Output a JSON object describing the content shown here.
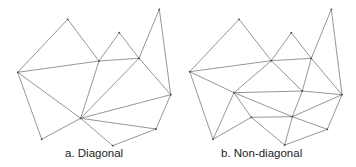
{
  "diagrams": [
    {
      "id": "diagonal",
      "caption": "a. Diagonal",
      "caption_x": 65,
      "vertices": {
        "A": [
          17.7,
          72.3
        ],
        "B": [
          67.7,
          19.3
        ],
        "C": [
          99,
          61
        ],
        "D": [
          119.3,
          32.7
        ],
        "E": [
          139,
          58.3
        ],
        "F": [
          159.3,
          9.3
        ],
        "G": [
          170.7,
          94.7
        ],
        "H": [
          80.7,
          118.3
        ],
        "I": [
          156,
          129
        ],
        "J": [
          112.7,
          145.7
        ],
        "K": [
          41.7,
          139.3
        ]
      },
      "edges": [
        [
          "A",
          "B"
        ],
        [
          "B",
          "C"
        ],
        [
          "A",
          "C"
        ],
        [
          "C",
          "D"
        ],
        [
          "D",
          "E"
        ],
        [
          "C",
          "E"
        ],
        [
          "E",
          "F"
        ],
        [
          "F",
          "G"
        ],
        [
          "E",
          "G"
        ],
        [
          "A",
          "H"
        ],
        [
          "C",
          "H"
        ],
        [
          "E",
          "H"
        ],
        [
          "G",
          "H"
        ],
        [
          "H",
          "I"
        ],
        [
          "I",
          "G"
        ],
        [
          "H",
          "J"
        ],
        [
          "J",
          "I"
        ],
        [
          "A",
          "K"
        ],
        [
          "K",
          "H"
        ]
      ]
    },
    {
      "id": "non-diagonal",
      "caption": "b. Non-diagonal",
      "caption_x": 221,
      "vertices": {
        "A": [
          189.7,
          71.7
        ],
        "B": [
          239,
          19.3
        ],
        "C": [
          271.3,
          60.7
        ],
        "D": [
          291.3,
          32.7
        ],
        "E": [
          311.3,
          58.3
        ],
        "F": [
          331.3,
          9.3
        ],
        "G": [
          342,
          94.7
        ],
        "P": [
          234,
          92.7
        ],
        "Q": [
          302.3,
          91
        ],
        "R": [
          251.3,
          117.3
        ],
        "S": [
          292.3,
          116.7
        ],
        "T": [
          327.3,
          129.3
        ],
        "J": [
          284.7,
          145
        ],
        "K": [
          213,
          139.3
        ]
      },
      "edges": [
        [
          "A",
          "B"
        ],
        [
          "B",
          "C"
        ],
        [
          "A",
          "C"
        ],
        [
          "C",
          "D"
        ],
        [
          "D",
          "E"
        ],
        [
          "C",
          "E"
        ],
        [
          "E",
          "F"
        ],
        [
          "F",
          "G"
        ],
        [
          "E",
          "G"
        ],
        [
          "E",
          "Q"
        ],
        [
          "C",
          "P"
        ],
        [
          "C",
          "Q"
        ],
        [
          "A",
          "P"
        ],
        [
          "P",
          "Q"
        ],
        [
          "Q",
          "G"
        ],
        [
          "P",
          "S"
        ],
        [
          "S",
          "G"
        ],
        [
          "Q",
          "S"
        ],
        [
          "P",
          "R"
        ],
        [
          "R",
          "S"
        ],
        [
          "A",
          "K"
        ],
        [
          "P",
          "K"
        ],
        [
          "K",
          "R"
        ],
        [
          "R",
          "J"
        ],
        [
          "S",
          "J"
        ],
        [
          "S",
          "T"
        ],
        [
          "T",
          "G"
        ],
        [
          "T",
          "J"
        ]
      ]
    }
  ],
  "style": {
    "stroke": "#8a8a8a",
    "vertex": "#444444"
  }
}
